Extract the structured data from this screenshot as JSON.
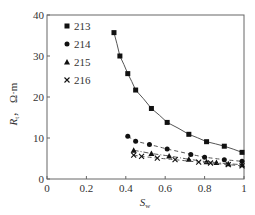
{
  "chart_data": {
    "type": "scatter",
    "title": "",
    "xlabel": "Sw",
    "ylabel": "Rt, Ω·m",
    "xlim": [
      0,
      1
    ],
    "ylim": [
      0,
      40
    ],
    "x_ticks": [
      "0",
      "0.2",
      "0.4",
      "0.6",
      "0.8",
      "1"
    ],
    "y_ticks": [
      "0",
      "10",
      "20",
      "30",
      "40"
    ],
    "grid": false,
    "legend_position": "upper left",
    "series": [
      {
        "name": "213",
        "marker": "square",
        "line": "solid",
        "x": [
          0.34,
          0.37,
          0.41,
          0.45,
          0.53,
          0.61,
          0.72,
          0.81,
          0.9,
          0.99
        ],
        "y": [
          35.7,
          30.0,
          25.7,
          21.7,
          17.2,
          13.8,
          10.9,
          9.1,
          8.0,
          6.5
        ]
      },
      {
        "name": "214",
        "marker": "circle",
        "line": "dashed",
        "x": [
          0.41,
          0.45,
          0.52,
          0.61,
          0.73,
          0.8,
          0.9,
          0.99
        ],
        "y": [
          10.4,
          9.2,
          8.4,
          7.3,
          6.0,
          5.3,
          4.7,
          4.3
        ]
      },
      {
        "name": "215",
        "marker": "triangle",
        "line": "dashdot",
        "x": [
          0.44,
          0.53,
          0.62,
          0.72,
          0.81,
          0.86,
          0.92,
          0.99
        ],
        "y": [
          7.0,
          6.2,
          5.6,
          4.8,
          4.2,
          4.0,
          3.7,
          3.5
        ]
      },
      {
        "name": "216",
        "marker": "cross",
        "line": "dashed",
        "x": [
          0.44,
          0.48,
          0.56,
          0.65,
          0.77,
          0.83,
          0.92,
          0.99
        ],
        "y": [
          5.8,
          5.5,
          5.1,
          4.7,
          4.1,
          3.9,
          3.5,
          3.2
        ]
      }
    ]
  },
  "axis": {
    "ylabel_main": "R",
    "ylabel_sub": "t",
    "ylabel_unit": "，  Ω·m",
    "xlabel_main": "S",
    "xlabel_sub": "w"
  }
}
